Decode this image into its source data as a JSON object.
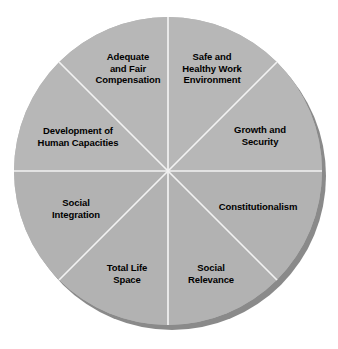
{
  "figure": {
    "name": "quality-of-work-life-wheel",
    "type": "segmented-circle-diagram",
    "segment_count": 8,
    "background_color": "#ffffff",
    "segment_fill_color": "#b4b4b4",
    "segment_fill_color_alt": "#b0b0b0",
    "divider_color": "#f2f2f2",
    "shadow_color": "#878787",
    "text_color": "#000000",
    "center_x": 168,
    "center_y": 171,
    "radius": 154
  },
  "segments": [
    {
      "id": "adequate-and-fair-compensation",
      "label": "Adequate\nand Fair\nCompensation",
      "start_angle_deg": 270,
      "end_angle_deg": 315,
      "label_x": 128,
      "label_y": 68
    },
    {
      "id": "safe-and-healthy-work-environment",
      "label": "Safe and\nHealthy Work\nEnvironment",
      "start_angle_deg": 315,
      "end_angle_deg": 360,
      "label_x": 212,
      "label_y": 68
    },
    {
      "id": "growth-and-security",
      "label": "Growth and\nSecurity",
      "start_angle_deg": 0,
      "end_angle_deg": 45,
      "label_x": 260,
      "label_y": 135
    },
    {
      "id": "constitutionalism",
      "label": "Constitutionalism",
      "start_angle_deg": 45,
      "end_angle_deg": 90,
      "label_x": 258,
      "label_y": 207
    },
    {
      "id": "social-relevance",
      "label": "Social\nRelevance",
      "start_angle_deg": 90,
      "end_angle_deg": 135,
      "label_x": 211,
      "label_y": 273
    },
    {
      "id": "total-life-space",
      "label": "Total Life\nSpace",
      "start_angle_deg": 135,
      "end_angle_deg": 180,
      "label_x": 127,
      "label_y": 273
    },
    {
      "id": "social-integration",
      "label": "Social\nIntegration",
      "start_angle_deg": 180,
      "end_angle_deg": 225,
      "label_x": 76,
      "label_y": 208
    },
    {
      "id": "development-of-human-capacities",
      "label": "Development of\nHuman Capacities",
      "start_angle_deg": 225,
      "end_angle_deg": 270,
      "label_x": 78,
      "label_y": 136
    }
  ]
}
